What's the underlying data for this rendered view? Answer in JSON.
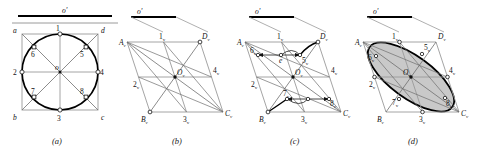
{
  "figure": {
    "title_marker": "o'",
    "panels": [
      {
        "caption": "(a)",
        "corner_labels": [
          "a",
          "d",
          "b",
          "c"
        ],
        "center_label": "o",
        "point_labels": [
          "1",
          "2",
          "3",
          "4",
          "5",
          "6",
          "7",
          "8"
        ],
        "description": "circle inscribed in square with eight division points"
      },
      {
        "caption": "(b)",
        "top_marker": "o'",
        "vertex_labels": [
          "A",
          "B",
          "C",
          "D",
          "O"
        ],
        "point_labels": [
          "1",
          "2",
          "3",
          "4"
        ],
        "subscript": "v",
        "description": "isometric rhombus with major axis points"
      },
      {
        "caption": "(c)",
        "top_marker": "o'",
        "vertex_labels": [
          "A",
          "B",
          "C",
          "D",
          "O"
        ],
        "point_labels": [
          "1",
          "2",
          "3",
          "4",
          "5",
          "6",
          "7",
          "8"
        ],
        "aux_label": "e",
        "subscript": "v",
        "description": "transfer of offset points with measurement arrows"
      },
      {
        "caption": "(d)",
        "top_marker": "o'",
        "vertex_labels": [
          "A",
          "B",
          "C",
          "D",
          "O"
        ],
        "point_labels": [
          "1",
          "2",
          "3",
          "4",
          "5",
          "6",
          "7",
          "8"
        ],
        "subscript": "v",
        "description": "completed shaded isometric ellipse"
      }
    ]
  },
  "colors": {
    "ink": "#111111",
    "thin_line": "#8a8a8a",
    "construction": "#6e6e6e",
    "ellipse_fill": "#c9c9c9",
    "heavy": "#000000",
    "background": "#ffffff"
  }
}
